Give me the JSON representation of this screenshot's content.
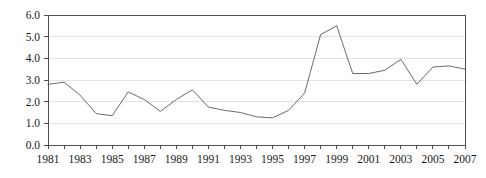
{
  "chart_data": {
    "type": "line",
    "title": "",
    "subtitle": "",
    "xlabel": "",
    "ylabel": "",
    "xlim": [
      1981,
      2007
    ],
    "ylim": [
      0.0,
      6.0
    ],
    "ytick_step": 1.0,
    "grid": true,
    "grid_axis": "y",
    "legend": false,
    "legend_position": "none",
    "annotations": [],
    "ytick_labels": [
      "0.0",
      "1.0",
      "2.0",
      "3.0",
      "4.0",
      "5.0",
      "6.0"
    ],
    "ytick_values": [
      0.0,
      1.0,
      2.0,
      3.0,
      4.0,
      5.0,
      6.0
    ],
    "xtick_values": [
      1981,
      1982,
      1983,
      1984,
      1985,
      1986,
      1987,
      1988,
      1989,
      1990,
      1991,
      1992,
      1993,
      1994,
      1995,
      1996,
      1997,
      1998,
      1999,
      2000,
      2001,
      2002,
      2003,
      2004,
      2005,
      2006,
      2007
    ],
    "xtick_labels": [
      "1981",
      "",
      "1983",
      "",
      "1985",
      "",
      "1987",
      "",
      "1989",
      "",
      "1991",
      "",
      "1993",
      "",
      "1995",
      "",
      "1997",
      "",
      "1999",
      "",
      "2001",
      "",
      "2003",
      "",
      "2005",
      "",
      "2007"
    ],
    "x": [
      1981,
      1982,
      1983,
      1984,
      1985,
      1986,
      1987,
      1988,
      1989,
      1990,
      1991,
      1992,
      1993,
      1994,
      1995,
      1996,
      1997,
      1998,
      1999,
      2000,
      2001,
      2002,
      2003,
      2004,
      2005,
      2006,
      2007
    ],
    "values": [
      2.8,
      2.9,
      2.3,
      1.45,
      1.35,
      2.45,
      2.1,
      1.55,
      2.1,
      2.55,
      1.75,
      1.6,
      1.5,
      1.3,
      1.25,
      1.6,
      2.4,
      5.1,
      5.5,
      3.3,
      3.3,
      3.45,
      3.95,
      2.8,
      3.6,
      3.65,
      3.5
    ],
    "series": [
      {
        "name": "series-1",
        "color": "#595959",
        "values": [
          2.8,
          2.9,
          2.3,
          1.45,
          1.35,
          2.45,
          2.1,
          1.55,
          2.1,
          2.55,
          1.75,
          1.6,
          1.5,
          1.3,
          1.25,
          1.6,
          2.4,
          5.1,
          5.5,
          3.3,
          3.3,
          3.45,
          3.95,
          2.8,
          3.6,
          3.65,
          3.5
        ]
      }
    ]
  },
  "style": {
    "line_color": "#595959",
    "grid_color": "#e2e2e2",
    "axis_color": "#4d4d4d",
    "tick_color": "#4d4d4d",
    "label_color": "#1a1a1a",
    "background": "#ffffff"
  },
  "geometry": {
    "plot_left": 48,
    "plot_right": 465,
    "plot_top": 15,
    "plot_bottom": 145
  }
}
